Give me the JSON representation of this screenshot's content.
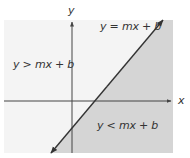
{
  "diagram": {
    "type": "linear-inequality-halfplanes",
    "axes": {
      "x_label": "x",
      "y_label": "y"
    },
    "line": {
      "label": "y = mx + b"
    },
    "regions": {
      "above": {
        "label": "y > mx + b",
        "color": "#f4f4f4"
      },
      "below": {
        "label": "y < mx + b",
        "color": "#d5d5d5"
      }
    },
    "colors": {
      "axis": "#444444",
      "line": "#333333",
      "text": "#333333"
    }
  }
}
